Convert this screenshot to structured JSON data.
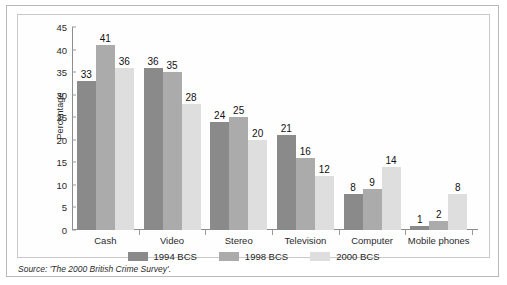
{
  "chart_data": {
    "type": "bar",
    "title": "",
    "xlabel": "",
    "ylabel": "Percentage",
    "ylim": [
      0,
      45
    ],
    "yticks": [
      0,
      5,
      10,
      15,
      20,
      25,
      30,
      35,
      40,
      45
    ],
    "grid": false,
    "legend_position": "bottom",
    "categories": [
      "Cash",
      "Video",
      "Stereo",
      "Television",
      "Computer",
      "Mobile phones"
    ],
    "series": [
      {
        "name": "1994 BCS",
        "color": "#8a8a8a",
        "values": [
          33,
          36,
          24,
          21,
          8,
          1
        ]
      },
      {
        "name": "1998 BCS",
        "color": "#ababab",
        "values": [
          41,
          35,
          25,
          16,
          9,
          2
        ]
      },
      {
        "name": "2000 BCS",
        "color": "#dedede",
        "values": [
          36,
          28,
          20,
          12,
          14,
          8
        ]
      }
    ],
    "source": "Source: 'The 2000 British Crime Survey'."
  }
}
